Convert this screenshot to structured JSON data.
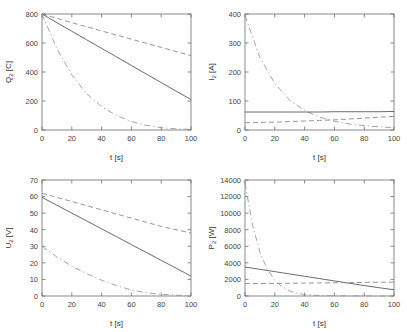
{
  "figure": {
    "layout": "2x2 subplot grid",
    "background": "#ffffff",
    "colors": {
      "axis": "#6d6d6d",
      "solid_curve": "#5a5a5a",
      "dashed_curve": "#8a8a8a",
      "dashdot_curve": "#9a9a9a",
      "text": "#333333"
    }
  },
  "chart_data": [
    {
      "id": "charge",
      "type": "line",
      "title": "",
      "xlabel": "t [s]",
      "ylabel": "Q_2 [C]",
      "ylabel_base": "Q",
      "ylabel_sub": "2",
      "ylabel_unit": "[C]",
      "xlim": [
        0,
        100
      ],
      "ylim": [
        0,
        800
      ],
      "xticks": [
        0,
        20,
        40,
        60,
        80,
        100
      ],
      "yticks": [
        0,
        200,
        400,
        600,
        800
      ],
      "grid": false,
      "legend": "none",
      "x": [
        0,
        10,
        20,
        30,
        40,
        50,
        60,
        70,
        80,
        90,
        100
      ],
      "series": [
        {
          "name": "slow-discharge",
          "style": "dashed",
          "values": [
            800,
            770,
            740,
            712,
            683,
            655,
            626,
            598,
            570,
            541,
            513
          ]
        },
        {
          "name": "linear-discharge",
          "style": "solid",
          "values": [
            800,
            740,
            681,
            622,
            563,
            504,
            445,
            386,
            327,
            268,
            210
          ]
        },
        {
          "name": "fast-discharge",
          "style": "dashdot",
          "values": [
            800,
            560,
            380,
            250,
            160,
            100,
            58,
            32,
            16,
            8,
            4
          ]
        }
      ]
    },
    {
      "id": "current",
      "type": "line",
      "title": "",
      "xlabel": "t [s]",
      "ylabel": "I_2 [A]",
      "ylabel_base": "I",
      "ylabel_sub": "2",
      "ylabel_unit": "[A]",
      "xlim": [
        0,
        100
      ],
      "ylim": [
        0,
        400
      ],
      "xticks": [
        0,
        20,
        40,
        60,
        80,
        100
      ],
      "yticks": [
        0,
        100,
        200,
        300,
        400
      ],
      "grid": false,
      "legend": "none",
      "x": [
        0,
        10,
        20,
        30,
        40,
        50,
        60,
        70,
        80,
        90,
        100
      ],
      "series": [
        {
          "name": "exponential-decay",
          "style": "dashdot",
          "values": [
            395,
            250,
            160,
            103,
            67,
            44,
            30,
            21,
            15,
            11,
            8
          ]
        },
        {
          "name": "constant-current",
          "style": "solid",
          "values": [
            62,
            62,
            62,
            62,
            62,
            62,
            63,
            63,
            63,
            63,
            64
          ]
        },
        {
          "name": "slow-rise",
          "style": "dashed",
          "values": [
            25,
            26,
            27,
            29,
            31,
            33,
            35,
            38,
            41,
            44,
            47
          ]
        }
      ]
    },
    {
      "id": "voltage",
      "type": "line",
      "title": "",
      "xlabel": "t [s]",
      "ylabel": "U_2 [V]",
      "ylabel_base": "U",
      "ylabel_sub": "2",
      "ylabel_unit": "[V]",
      "xlim": [
        0,
        100
      ],
      "ylim": [
        0,
        70
      ],
      "xticks": [
        0,
        20,
        40,
        60,
        80,
        100
      ],
      "yticks": [
        0,
        10,
        20,
        30,
        40,
        50,
        60,
        70
      ],
      "grid": false,
      "legend": "none",
      "x": [
        0,
        10,
        20,
        30,
        40,
        50,
        60,
        70,
        80,
        90,
        100
      ],
      "series": [
        {
          "name": "slow-drop",
          "style": "dashed",
          "values": [
            62,
            59.5,
            57,
            54.5,
            52,
            49.5,
            47,
            44.5,
            42,
            40,
            38
          ]
        },
        {
          "name": "linear-drop",
          "style": "solid",
          "values": [
            59.5,
            54.8,
            50,
            45.3,
            40.5,
            35.8,
            31,
            26.3,
            21.5,
            16.8,
            12
          ]
        },
        {
          "name": "fast-drop",
          "style": "dashdot",
          "values": [
            30,
            23.5,
            18,
            13.5,
            9.5,
            6.3,
            3.6,
            2.0,
            1.0,
            0.5,
            0.2
          ]
        }
      ]
    },
    {
      "id": "power",
      "type": "line",
      "title": "",
      "xlabel": "t [s]",
      "ylabel": "P_2 [W]",
      "ylabel_base": "P",
      "ylabel_sub": "2",
      "ylabel_unit": "[W]",
      "xlim": [
        0,
        100
      ],
      "ylim": [
        0,
        14000
      ],
      "xticks": [
        0,
        20,
        40,
        60,
        80,
        100
      ],
      "yticks": [
        0,
        2000,
        4000,
        6000,
        8000,
        10000,
        12000,
        14000
      ],
      "grid": false,
      "legend": "none",
      "x": [
        0,
        5,
        10,
        15,
        20,
        25,
        30,
        35,
        40,
        50,
        60,
        70,
        80,
        90,
        100
      ],
      "series": [
        {
          "name": "power-spike-decay",
          "style": "dashdot",
          "values": [
            13600,
            8600,
            5300,
            3200,
            1900,
            1100,
            620,
            340,
            170,
            60,
            25,
            12,
            6,
            3,
            2
          ]
        },
        {
          "name": "linear-power",
          "style": "solid",
          "values": [
            3500,
            3360,
            3220,
            3080,
            2940,
            2800,
            2660,
            2520,
            2380,
            2100,
            1820,
            1540,
            1260,
            1000,
            750
          ]
        },
        {
          "name": "constant-power",
          "style": "dashed",
          "values": [
            1500,
            1500,
            1510,
            1510,
            1520,
            1530,
            1540,
            1550,
            1560,
            1580,
            1600,
            1620,
            1640,
            1660,
            1680
          ]
        }
      ]
    }
  ]
}
